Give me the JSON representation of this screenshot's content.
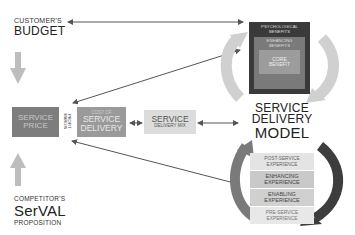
{
  "left": {
    "customers_small": "CUSTOMER'S",
    "customers_big": "BUDGET",
    "competitor_small": "COMPETITOR'S",
    "competitor_big": "SerVAL",
    "competitor_sub": "PROPOSITION"
  },
  "price_box": {
    "line1": "SERVICE",
    "line2": "PRICE"
  },
  "profit_margin": {
    "line1": "PROFIT",
    "line2": "MARGIN"
  },
  "cost_box": {
    "small": "COST OF",
    "line1": "SERVICE",
    "line2": "DELIVERY"
  },
  "mix_box": {
    "big": "SERVICE",
    "small": "DELIVERY MIX"
  },
  "benefits": {
    "outer": "PSYCHOLOGICAL BENEFITS",
    "middle": "ENHANCING BENEFITS",
    "core_line1": "CORE",
    "core_line2": "BENEFIT"
  },
  "model": {
    "line1": "SERVICE",
    "line2": "DELIVERY",
    "line3": "MODEL"
  },
  "experience": [
    {
      "line1": "POST-SERVICE",
      "line2": "EXPERIENCE"
    },
    {
      "line1": "ENHANCING",
      "line2": "EXPERIENCE"
    },
    {
      "line1": "ENABLING",
      "line2": "EXPERIENCE"
    },
    {
      "line1": "PRE-SERVICE",
      "line2": "EXPERIENCE"
    }
  ],
  "colors": {
    "price": "#7d7d7d",
    "cost": "#9a9a9a",
    "mix": "#dcdcdc",
    "benefit_outer": "#3a3a3a",
    "benefit_mid": "#7a7a7a",
    "benefit_core": "#9c9c9c",
    "arrow_light": "#c8c8c8",
    "arrow_dark": "#444444"
  }
}
